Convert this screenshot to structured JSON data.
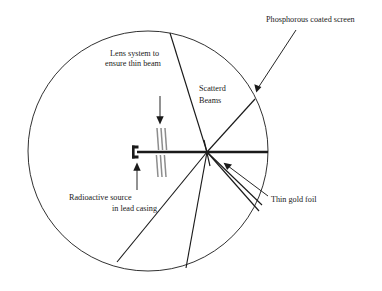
{
  "figure": {
    "background_color": "#ffffff",
    "ink_color": "#1a1a1a",
    "lens_color": "#8d8d8d",
    "labels": {
      "screen": "Phosphorous coated screen",
      "lens_line1": "Lens system to",
      "lens_line2": "ensure thin beam",
      "scattered_line1": "Scatterd",
      "scattered_line2": "Beams",
      "source_line1": "Radioactive source",
      "source_line2": "in lead casing",
      "foil": "Thin gold foil"
    },
    "parts": {
      "chamber": "circular vacuum chamber outline",
      "screen": "phosphorous coated screen (circle rim)",
      "source": "radioactive source in lead casing",
      "lens": "collimating lens slit system",
      "beam": "incident thin beam",
      "foil": "thin gold foil at scattering node",
      "scattered": "scattered alpha particle beams"
    }
  }
}
